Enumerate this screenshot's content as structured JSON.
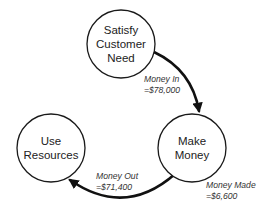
{
  "diagram": {
    "type": "cycle",
    "nodes": [
      {
        "id": "satisfy",
        "lines": [
          "Satisfy",
          "Customer",
          "Need"
        ],
        "cx": 121,
        "cy": 44,
        "r": 34
      },
      {
        "id": "make",
        "lines": [
          "Make",
          "Money"
        ],
        "cx": 192,
        "cy": 148,
        "r": 34
      },
      {
        "id": "use",
        "lines": [
          "Use",
          "Resources"
        ],
        "cx": 51,
        "cy": 148,
        "r": 34
      }
    ],
    "edges": [
      {
        "from": "satisfy",
        "to": "make",
        "label_line1": "Money In",
        "label_line2": "=$78,000"
      },
      {
        "from": "make",
        "to": "use",
        "label_line1": "Money Out",
        "label_line2": "=$71,400"
      }
    ],
    "annotations": [
      {
        "near": "make",
        "line1": "Money Made",
        "line2": "=$6,600"
      }
    ],
    "colors": {
      "stroke": "#111111",
      "text": "#222222",
      "label": "#333333",
      "background": "#ffffff"
    }
  }
}
